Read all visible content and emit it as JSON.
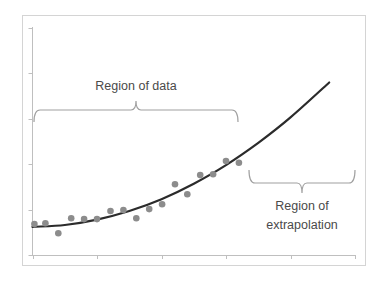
{
  "chart_data": {
    "type": "scatter",
    "title": "",
    "xlabel": "",
    "ylabel": "",
    "xlim": [
      0,
      5
    ],
    "ylim": [
      0,
      5
    ],
    "grid": false,
    "legend": null,
    "x_ticks": [
      0,
      1,
      2,
      3,
      4,
      5
    ],
    "y_ticks": [
      0,
      1,
      2,
      3,
      4,
      5
    ],
    "tick_labels_visible": false,
    "series": [
      {
        "name": "data",
        "kind": "scatter",
        "color": "#8c8c8c",
        "x": [
          0.03,
          0.2,
          0.4,
          0.6,
          0.8,
          1.0,
          1.21,
          1.41,
          1.61,
          1.81,
          2.01,
          2.21,
          2.4,
          2.6,
          2.8,
          3.0,
          3.2
        ],
        "y": [
          0.68,
          0.7,
          0.48,
          0.81,
          0.79,
          0.79,
          0.97,
          0.99,
          0.81,
          1.01,
          1.12,
          1.56,
          1.34,
          1.76,
          1.78,
          2.07,
          2.03
        ]
      },
      {
        "name": "fitted curve",
        "kind": "line",
        "color": "#2b2b2b",
        "x": [
          0.0,
          0.5,
          1.0,
          1.5,
          2.0,
          2.5,
          3.0,
          3.5,
          4.0,
          4.6
        ],
        "y": [
          0.62,
          0.66,
          0.78,
          0.97,
          1.23,
          1.57,
          1.98,
          2.47,
          3.03,
          3.8
        ]
      }
    ],
    "annotations": [
      {
        "text": "Region of data",
        "type": "brace",
        "x_range": [
          0.03,
          3.19
        ],
        "position": "above-curve"
      },
      {
        "text": "Region of extrapolation",
        "lines": [
          "Region of",
          "extrapolation"
        ],
        "type": "brace",
        "x_range": [
          3.36,
          5.0
        ],
        "position": "below-curve"
      }
    ]
  },
  "labels": {
    "region_data": "Region of data",
    "region_extrap_line1": "Region of",
    "region_extrap_line2": "extrapolation"
  }
}
